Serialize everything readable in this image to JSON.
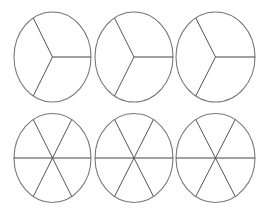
{
  "diagram": {
    "stroke_color": "#7a7a7a",
    "spoke_color": "#555555",
    "background": "#ffffff",
    "rows": [
      {
        "divisions": 3,
        "circles": [
          {
            "cx": 52.5,
            "cy": 57,
            "rx": 38.5,
            "ry": 45
          },
          {
            "cx": 134,
            "cy": 57,
            "rx": 39,
            "ry": 45
          },
          {
            "cx": 215.5,
            "cy": 57,
            "rx": 39.5,
            "ry": 45
          }
        ]
      },
      {
        "divisions": 6,
        "circles": [
          {
            "cx": 52.5,
            "cy": 158,
            "rx": 38.5,
            "ry": 44.5
          },
          {
            "cx": 134,
            "cy": 158,
            "rx": 39,
            "ry": 44.5
          },
          {
            "cx": 215.5,
            "cy": 158,
            "rx": 39.5,
            "ry": 44.5
          }
        ]
      }
    ]
  }
}
